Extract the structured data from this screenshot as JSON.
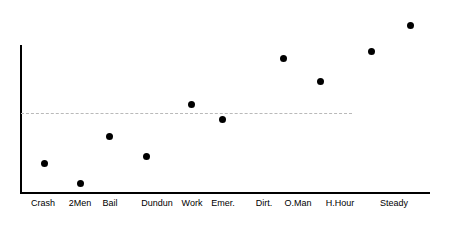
{
  "chart_data": {
    "type": "scatter",
    "title": "",
    "subtitle": "",
    "xlabel": "",
    "ylabel": "",
    "categories": [
      "Crash",
      "2Men",
      "Bail",
      "Dundun",
      "Work",
      "Emer.",
      "Dirt.",
      "O.Man",
      "H.Hour",
      "Steady"
    ],
    "values": [
      0.2,
      0.07,
      0.385,
      0.25,
      0.6,
      0.5,
      0.91,
      0.755,
      0.955,
      1.13
    ],
    "points": [
      {
        "label": "Crash",
        "x_px": 44,
        "y_px": 163,
        "value": 0.2
      },
      {
        "label": "2Men",
        "x_px": 80,
        "y_px": 183,
        "value": 0.07
      },
      {
        "label": "Bail",
        "x_px": 109,
        "y_px": 136,
        "value": 0.385
      },
      {
        "label": "Dundun",
        "x_px": 146,
        "y_px": 156,
        "value": 0.25
      },
      {
        "label": "Work",
        "x_px": 191,
        "y_px": 104,
        "value": 0.6
      },
      {
        "label": "Emer.",
        "x_px": 222,
        "y_px": 119,
        "value": 0.5
      },
      {
        "label": "Dirt.",
        "x_px": 283,
        "y_px": 58,
        "value": 0.91
      },
      {
        "label": "O.Man",
        "x_px": 320,
        "y_px": 81,
        "value": 0.755
      },
      {
        "label": "H.Hour",
        "x_px": 371,
        "y_px": 51,
        "value": 0.955
      },
      {
        "label": "Steady",
        "x_px": 410,
        "y_px": 25,
        "value": 1.13
      }
    ],
    "tick_label_x_px": [
      43,
      80,
      110,
      157,
      192,
      223,
      264,
      298,
      340,
      394
    ],
    "reference_line": {
      "value": 0.535,
      "y_px": 113,
      "style": "dashed",
      "color": "#b9b9b9",
      "x_start_px": 21,
      "x_end_px": 352,
      "label": ""
    },
    "grid": false,
    "legend": null,
    "legend_position": "none",
    "axes": {
      "y_axis_x_px": 20,
      "y_axis_top_px": 45,
      "baseline_y_px": 192,
      "x_axis_start_px": 20,
      "x_axis_end_px": 430,
      "y_tick_labels": [],
      "axis_color": "#000000"
    },
    "marker": {
      "shape": "circle",
      "color": "#000000",
      "size_px": 7
    }
  }
}
